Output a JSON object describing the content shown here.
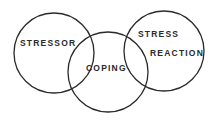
{
  "diagram": {
    "type": "venn",
    "labels": {
      "stressor": "STRESSOR",
      "coping": "COPING",
      "stress_reaction_line1": "STRESS",
      "stress_reaction_line2": "REACTION"
    },
    "circles": [
      {
        "name": "Stressor",
        "cx": 54,
        "cy": 53,
        "r": 40
      },
      {
        "name": "Coping",
        "cx": 108,
        "cy": 72,
        "r": 40
      },
      {
        "name": "Stress Reaction",
        "cx": 164,
        "cy": 51,
        "r": 40
      }
    ],
    "stroke_color": "#2a2a2a",
    "background": "#ffffff"
  }
}
